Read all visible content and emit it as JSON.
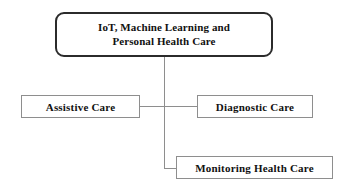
{
  "diagram": {
    "type": "tree",
    "root": {
      "id": "root",
      "line1": "IoT, Machine Learning and",
      "line2": "Personal Health Care",
      "shape": "rounded-rectangle",
      "border_color": "#2b2b2b",
      "fill_color": "#ffffff"
    },
    "children": [
      {
        "id": "assistive",
        "label": "Assistive Care",
        "shape": "rectangle",
        "border_color": "#8e8e8e",
        "fill_color": "#ffffff"
      },
      {
        "id": "diagnostic",
        "label": "Diagnostic Care",
        "shape": "rectangle",
        "border_color": "#8e8e8e",
        "fill_color": "#ffffff"
      },
      {
        "id": "monitoring",
        "label": "Monitoring Health Care",
        "shape": "rectangle",
        "border_color": "#8e8e8e",
        "fill_color": "#ffffff"
      }
    ],
    "connector_color": "#8e8e8e",
    "background_color": "#ffffff"
  }
}
